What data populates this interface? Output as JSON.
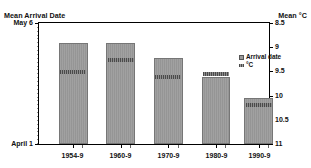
{
  "chart_data": {
    "type": "bar",
    "title": "",
    "subtitle": "",
    "categories": [
      "1954-9",
      "1960-9",
      "1970-9",
      "1980-9",
      "1990-9"
    ],
    "series": [
      {
        "name": "Arrival date",
        "axis": "left",
        "unit": "date",
        "values": [
          "May 1",
          "May 1",
          "April 25",
          "April 19",
          "April 13"
        ],
        "value_positions_pct": [
          84,
          84,
          71,
          56,
          39
        ]
      },
      {
        "name": "°C",
        "axis": "right",
        "unit": "°C",
        "values": [
          9.4,
          9.15,
          9.45,
          9.35,
          9.95
        ]
      }
    ],
    "left_axis": {
      "label": "Mean Arrival Date",
      "ticks": [
        "May 6",
        "April 1"
      ],
      "top_label": "May 6",
      "bottom_label": "April 1",
      "inverted": false
    },
    "right_axis": {
      "label": "Mean °C",
      "ticks": [
        "8.5",
        "9",
        "9.5",
        "10",
        "10.5",
        "11"
      ],
      "min": 8.5,
      "max": 11,
      "inverted": true
    },
    "xlabel": "",
    "ylabel": "Mean Arrival Date",
    "grid": false,
    "legend_position": "inside-top-right",
    "legend": [
      "Arrival date",
      "°C"
    ]
  },
  "axes": {
    "left_title": "Mean Arrival Date",
    "right_title": "Mean °C",
    "left_ticks": [
      {
        "label": "May 6",
        "pos_pct": 0
      },
      {
        "label": "April 1",
        "pos_pct": 100
      }
    ],
    "right_ticks": [
      {
        "label": "8.5",
        "pos_pct": 0
      },
      {
        "label": "9",
        "pos_pct": 20
      },
      {
        "label": "9.5",
        "pos_pct": 40
      },
      {
        "label": "10",
        "pos_pct": 60
      },
      {
        "label": "10.5",
        "pos_pct": 80
      },
      {
        "label": "11",
        "pos_pct": 100
      }
    ]
  },
  "bars": [
    {
      "category": "1954-9",
      "left_pct": 8.6,
      "width_pct": 12.5,
      "top_pct": 16.3,
      "band_top_pct": 39.0
    },
    {
      "category": "1960-9",
      "left_pct": 29.3,
      "width_pct": 12.5,
      "top_pct": 16.3,
      "band_top_pct": 29.3
    },
    {
      "category": "1970-9",
      "left_pct": 50.0,
      "width_pct": 12.5,
      "top_pct": 29.3,
      "band_top_pct": 43.1
    },
    {
      "category": "1980-9",
      "left_pct": 70.7,
      "width_pct": 12.5,
      "top_pct": 44.7,
      "band_top_pct": 40.7
    },
    {
      "category": "1990-9",
      "left_pct": 89.2,
      "width_pct": 12.5,
      "top_pct": 61.8,
      "band_top_pct": 65.9
    }
  ],
  "legend": {
    "arrival_date": "Arrival date",
    "temperature": "°C"
  }
}
